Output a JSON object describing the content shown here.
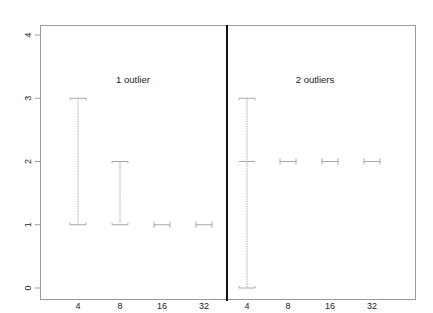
{
  "chart_data": {
    "type": "errorbar",
    "layout": "two-panel",
    "ylim": [
      0,
      4
    ],
    "yticks": [
      0,
      1,
      2,
      3,
      4
    ],
    "xlabel": "",
    "ylabel": "",
    "grid": false,
    "panels": [
      {
        "title": "1 outlier",
        "categories": [
          "4",
          "8",
          "16",
          "32"
        ],
        "intervals": [
          {
            "x": "4",
            "low": 1,
            "high": 3,
            "center": null
          },
          {
            "x": "8",
            "low": 1,
            "high": 2,
            "center": null
          },
          {
            "x": "16",
            "low": 1,
            "high": 1,
            "center": null
          },
          {
            "x": "32",
            "low": 1,
            "high": 1,
            "center": null
          }
        ]
      },
      {
        "title": "2 outliers",
        "categories": [
          "4",
          "8",
          "16",
          "32"
        ],
        "intervals": [
          {
            "x": "4",
            "low": 0,
            "high": 3,
            "center": 2
          },
          {
            "x": "8",
            "low": 2,
            "high": 2,
            "center": null
          },
          {
            "x": "16",
            "low": 2,
            "high": 2,
            "center": null
          },
          {
            "x": "32",
            "low": 2,
            "high": 2,
            "center": null
          }
        ]
      }
    ]
  },
  "colors": {
    "axis": "#9a9a9a",
    "divider": "#111111",
    "interval": "#a8a8a8",
    "text": "#222222"
  }
}
